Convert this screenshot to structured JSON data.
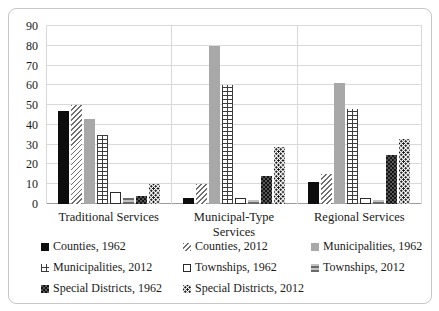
{
  "chart_data": {
    "type": "bar",
    "title": "",
    "categories": [
      "Traditional Services",
      "Municipal-Type Services",
      "Regional Services"
    ],
    "series": [
      {
        "name": "Counties, 1962",
        "pattern": "solid-black",
        "fill": "#0d0d0d",
        "values": [
          47,
          3,
          11
        ]
      },
      {
        "name": "Counties, 2012",
        "pattern": "diag-hatch",
        "fill": "#ffffff",
        "values": [
          50,
          10,
          15
        ]
      },
      {
        "name": "Municipalities, 1962",
        "pattern": "solid-gray",
        "fill": "#a8a8a8",
        "values": [
          43,
          80,
          61
        ]
      },
      {
        "name": "Municipalities, 2012",
        "pattern": "brick",
        "fill": "#ffffff",
        "values": [
          35,
          60,
          48
        ]
      },
      {
        "name": "Townships, 1962",
        "pattern": "white-outline",
        "fill": "#ffffff",
        "values": [
          6,
          3,
          3
        ]
      },
      {
        "name": "Townships, 2012",
        "pattern": "gray-stripes",
        "fill": "#c2c2c2",
        "values": [
          3,
          2,
          2
        ]
      },
      {
        "name": "Special Districts, 1962",
        "pattern": "dark-check",
        "fill": "#141414",
        "values": [
          4,
          14,
          25
        ]
      },
      {
        "name": "Special Districts, 2012",
        "pattern": "dots",
        "fill": "#ffffff",
        "values": [
          10,
          29,
          33
        ]
      }
    ],
    "xlabel": "",
    "ylabel": "",
    "ylim": [
      0,
      90
    ],
    "ytick_step": 10,
    "yticks": [
      0,
      10,
      20,
      30,
      40,
      50,
      60,
      70,
      80,
      90
    ],
    "grid": true,
    "gridline_color": "#d9d9d9",
    "axis_color": "#9b9b9b",
    "border_color": "#c7c7c7",
    "legend_position": "bottom"
  }
}
